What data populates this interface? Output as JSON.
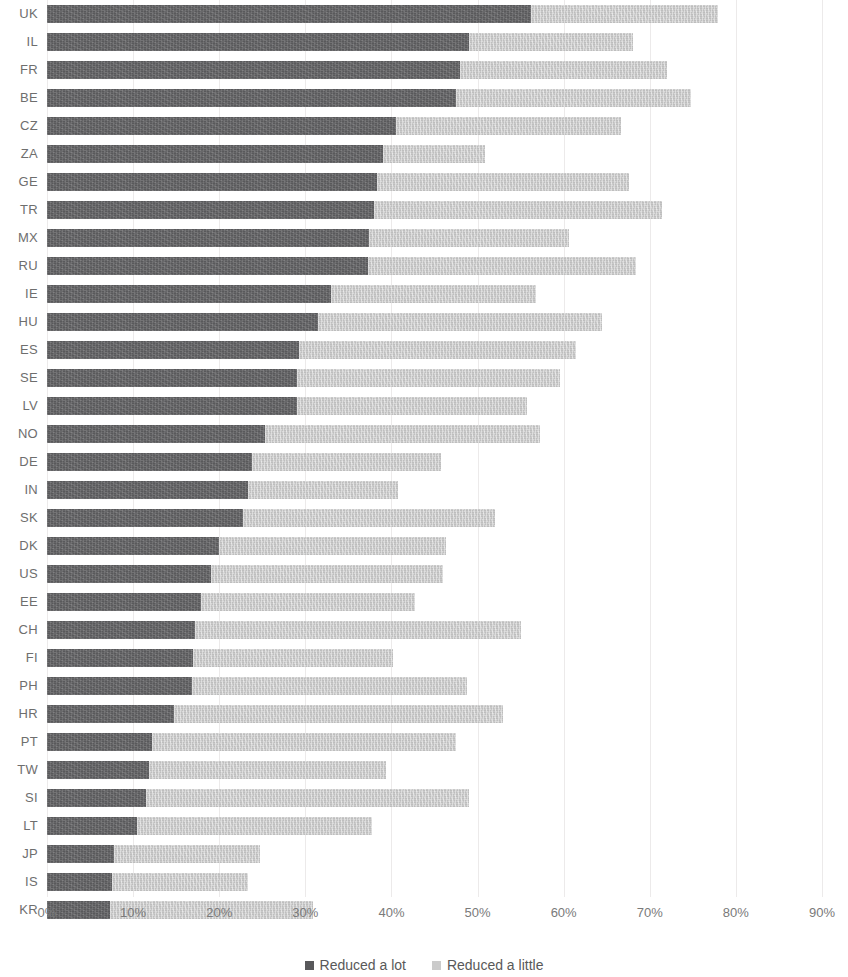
{
  "chart_data": {
    "type": "bar",
    "subtype": "stacked-horizontal-bar",
    "title": "",
    "xlabel": "",
    "ylabel": "",
    "xlim": [
      0,
      90
    ],
    "xticks": [
      "0%",
      "10%",
      "20%",
      "30%",
      "40%",
      "50%",
      "60%",
      "70%",
      "80%",
      "90%"
    ],
    "xtick_values": [
      0,
      10,
      20,
      30,
      40,
      50,
      60,
      70,
      80,
      90
    ],
    "grid": true,
    "grid_axis": "x",
    "legend_position": "bottom",
    "orientation": "horizontal",
    "stacked": true,
    "categories": [
      "UK",
      "IL",
      "FR",
      "BE",
      "CZ",
      "ZA",
      "GE",
      "TR",
      "MX",
      "RU",
      "IE",
      "HU",
      "ES",
      "SE",
      "LV",
      "NO",
      "DE",
      "IN",
      "SK",
      "DK",
      "US",
      "EE",
      "CH",
      "FI",
      "PH",
      "HR",
      "PT",
      "TW",
      "SI",
      "LT",
      "JP",
      "IS",
      "KR"
    ],
    "series": [
      {
        "name": "Reduced a lot",
        "color": "#59595b",
        "values": [
          56.2,
          49.0,
          48.0,
          47.5,
          40.5,
          39.0,
          38.3,
          38.0,
          37.4,
          37.3,
          33.0,
          31.5,
          29.3,
          29.0,
          29.0,
          25.3,
          23.8,
          23.3,
          22.8,
          20.0,
          19.0,
          17.9,
          17.2,
          17.0,
          16.8,
          14.8,
          12.2,
          11.8,
          11.5,
          10.5,
          7.8,
          7.5,
          7.3
        ]
      },
      {
        "name": "Reduced a little",
        "color": "#c9c9c9",
        "values": [
          21.7,
          19.0,
          24.0,
          27.3,
          26.2,
          11.9,
          29.3,
          33.4,
          23.2,
          31.1,
          23.8,
          32.9,
          32.1,
          30.6,
          26.8,
          32.0,
          22.0,
          17.5,
          29.2,
          26.3,
          27.0,
          24.8,
          37.9,
          23.2,
          32.0,
          38.1,
          35.3,
          27.6,
          37.5,
          27.3,
          16.9,
          15.9,
          23.6
        ]
      }
    ],
    "totals": [
      77.9,
      68.0,
      72.0,
      74.8,
      66.7,
      50.9,
      67.6,
      71.4,
      60.6,
      68.4,
      56.8,
      64.4,
      61.4,
      59.6,
      55.8,
      57.3,
      45.8,
      40.8,
      52.0,
      46.3,
      46.0,
      42.7,
      55.1,
      40.2,
      48.8,
      52.9,
      47.5,
      39.4,
      49.0,
      37.8,
      24.7,
      23.4,
      30.9
    ]
  },
  "legend": {
    "items": [
      {
        "label": "Reduced a lot",
        "swatch": "dark-square"
      },
      {
        "label": "Reduced a little",
        "swatch": "light-square"
      }
    ]
  },
  "colors": {
    "series_a": "#59595b",
    "series_b": "#c9c9c9",
    "gridline": "#eceaea",
    "text": "#6e6e6e",
    "background": "#ffffff"
  }
}
